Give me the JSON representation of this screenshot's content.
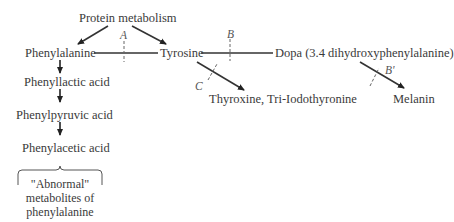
{
  "diagram": {
    "nodes": {
      "protein_metabolism": "Protein metabolism",
      "phenylalanine": "Phenylalanine",
      "tyrosine": "Tyrosine",
      "dopa": "Dopa (3.4 dihydroxyphenylalanine)",
      "thyroxine": "Thyroxine, Tri-Iodothyronine",
      "melanin": "Melanin",
      "phenyllactic_acid": "Phenyllactic acid",
      "phenylpyruvic_acid": "Phenylpyruvic acid",
      "phenylacetic_acid": "Phenylacetic acid"
    },
    "block_labels": {
      "a": "A",
      "b": "B",
      "b_prime": "B'",
      "c": "C"
    },
    "bracket_note": {
      "line1": "\"Abnormal\"",
      "line2": "metabolites of",
      "line3": "phenylalanine"
    },
    "colors": {
      "text": "#3a3a3a",
      "line": "#333333"
    }
  }
}
